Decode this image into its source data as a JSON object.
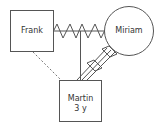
{
  "diagram": {
    "type": "genogram",
    "nodes": [
      {
        "id": "frank",
        "shape": "square",
        "label": "Frank"
      },
      {
        "id": "miriam",
        "shape": "circle",
        "label": "Miriam"
      },
      {
        "id": "martin",
        "shape": "square",
        "label": "Martin",
        "sublabel": "3 y"
      }
    ],
    "relationships": [
      {
        "from": "frank",
        "to": "miriam",
        "style": "conflict-zigzag"
      },
      {
        "from": "frank",
        "to": "martin",
        "style": "distant-dashed"
      },
      {
        "from": "marriage-line",
        "to": "martin",
        "style": "child-line"
      },
      {
        "from": "miriam",
        "to": "martin",
        "style": "fused-hostile-triple"
      }
    ],
    "colors": {
      "stroke": "#555555",
      "text": "#333333",
      "background": "#ffffff"
    }
  }
}
